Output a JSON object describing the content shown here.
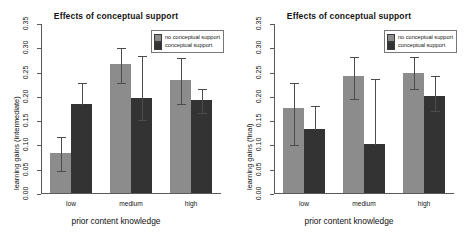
{
  "chart_data": [
    {
      "type": "bar",
      "title": "Effects of conceptual support",
      "xlabel": "prior content knowledge",
      "ylabel": "learning gains (intermediate)",
      "categories": [
        "low",
        "medium",
        "high"
      ],
      "yticks": [
        "0.00",
        "0.05",
        "0.10",
        "0.15",
        "0.20",
        "0.25",
        "0.30",
        "0.35"
      ],
      "ylim": [
        0.0,
        0.35
      ],
      "grid": false,
      "legend_position": "top-right",
      "series": [
        {
          "name": "no conceptual support",
          "color": "#8c8c8c",
          "values": [
            0.082,
            0.265,
            0.232
          ],
          "err_low": [
            0.047,
            0.229,
            0.185
          ],
          "err_high": [
            0.118,
            0.3,
            0.279
          ]
        },
        {
          "name": "conceptual support",
          "color": "#333333",
          "values": [
            0.183,
            0.196,
            0.191
          ],
          "err_low": [
            0.183,
            0.152,
            0.167
          ],
          "err_high": [
            0.228,
            0.285,
            0.216
          ]
        }
      ]
    },
    {
      "type": "bar",
      "title": "Effects of conceptual support",
      "xlabel": "prior content knowledge",
      "ylabel": "learning gains (final)",
      "categories": [
        "low",
        "medium",
        "high"
      ],
      "yticks": [
        "0.00",
        "0.05",
        "0.10",
        "0.15",
        "0.20",
        "0.25",
        "0.30",
        "0.35"
      ],
      "ylim": [
        0.0,
        0.35
      ],
      "grid": false,
      "legend_position": "top-right",
      "series": [
        {
          "name": "no conceptual support",
          "color": "#8c8c8c",
          "values": [
            0.175,
            0.24,
            0.248
          ],
          "err_low": [
            0.1,
            0.196,
            0.216
          ],
          "err_high": [
            0.228,
            0.283,
            0.282
          ]
        },
        {
          "name": "conceptual support",
          "color": "#333333",
          "values": [
            0.132,
            0.101,
            0.2
          ],
          "err_low": [
            0.132,
            0.101,
            0.17
          ],
          "err_high": [
            0.182,
            0.236,
            0.242
          ]
        }
      ]
    }
  ],
  "legend": {
    "no_support_label": "no conceptual support",
    "support_label": "conceptual support"
  },
  "colors": {
    "no_support": "#8c8c8c",
    "support": "#333333",
    "axis": "#5a5a5a",
    "error_bar": "#4c4c4c"
  }
}
